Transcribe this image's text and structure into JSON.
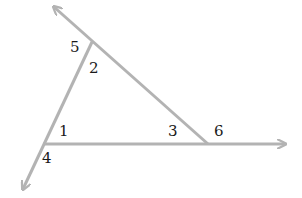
{
  "diagram": {
    "type": "triangle-exterior-angles",
    "line_color": "#b3b3b3",
    "label_color": "#1a1a1a",
    "vertices": {
      "top": {
        "x": 92,
        "y": 42
      },
      "bottom_left": {
        "x": 43,
        "y": 144
      },
      "bottom_right": {
        "x": 208,
        "y": 144
      }
    },
    "rays": [
      {
        "name": "ray-upper-left",
        "from": "bottom_right",
        "through": "top",
        "tip": {
          "x": 54,
          "y": 7
        }
      },
      {
        "name": "ray-lower-left",
        "from": "top",
        "through": "bottom_left",
        "tip": {
          "x": 23,
          "y": 189
        }
      },
      {
        "name": "ray-right",
        "from": "bottom_left",
        "through": "bottom_right",
        "tip": {
          "x": 285,
          "y": 144
        }
      }
    ],
    "labels": [
      {
        "text": "5",
        "x": 70,
        "y": 52
      },
      {
        "text": "2",
        "x": 89,
        "y": 73
      },
      {
        "text": "1",
        "x": 59,
        "y": 136
      },
      {
        "text": "4",
        "x": 42,
        "y": 163
      },
      {
        "text": "3",
        "x": 168,
        "y": 136
      },
      {
        "text": "6",
        "x": 214,
        "y": 136
      }
    ]
  }
}
